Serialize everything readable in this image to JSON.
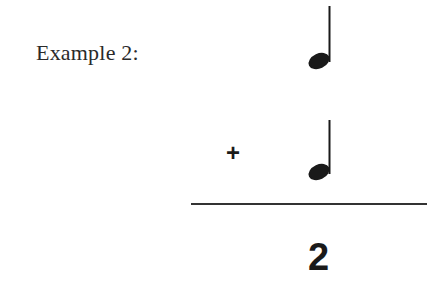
{
  "example": {
    "label": "Example 2:",
    "operator": "+",
    "result": "2",
    "notes": [
      {
        "name": "quarter-note",
        "beats": 1
      },
      {
        "name": "quarter-note",
        "beats": 1
      }
    ],
    "ink_color": "#1a1a1a"
  }
}
